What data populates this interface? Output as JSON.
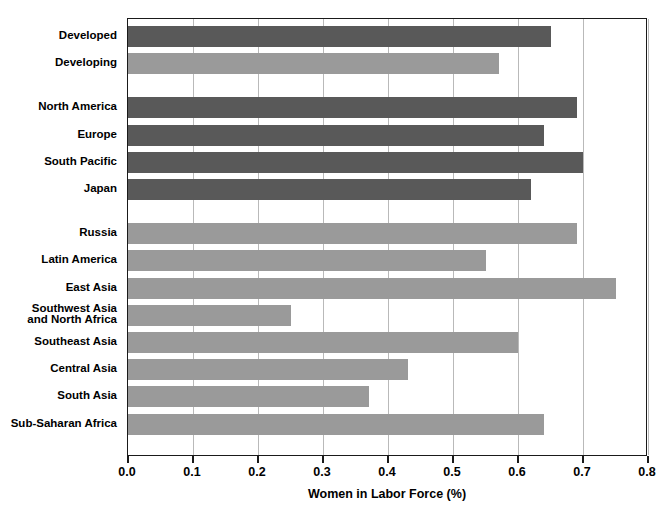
{
  "chart_data": {
    "type": "bar",
    "orientation": "horizontal",
    "title": "",
    "xlabel": "Women in Labor Force (%)",
    "ylabel": "",
    "xlim": [
      0.0,
      0.8
    ],
    "xticks": [
      "0.0",
      "0.1",
      "0.2",
      "0.3",
      "0.4",
      "0.5",
      "0.6",
      "0.7",
      "0.8"
    ],
    "xtick_values": [
      0.0,
      0.1,
      0.2,
      0.3,
      0.4,
      0.5,
      0.6,
      0.7,
      0.8
    ],
    "grid": "vertical",
    "legend": "none",
    "colors": {
      "dark_bar": "#595959",
      "light_bar": "#9a9a9a",
      "gridline": "#b9b9b9",
      "axis": "#1a1a1a"
    },
    "categories": [
      "Developed",
      "Developing",
      "North America",
      "Europe",
      "South Pacific",
      "Japan",
      "Russia",
      "Latin America",
      "East Asia",
      "Southwest Asia\nand North Africa",
      "Southeast Asia",
      "Central Asia",
      "South Asia",
      "Sub-Saharan Africa"
    ],
    "values": [
      0.65,
      0.57,
      0.69,
      0.64,
      0.7,
      0.62,
      0.69,
      0.55,
      0.75,
      0.25,
      0.6,
      0.43,
      0.37,
      0.64
    ],
    "bars": [
      {
        "label": "Developed",
        "value": 0.65,
        "shade": "dark",
        "group": 0
      },
      {
        "label": "Developing",
        "value": 0.57,
        "shade": "light",
        "group": 0
      },
      {
        "label": "North America",
        "value": 0.69,
        "shade": "dark",
        "group": 1
      },
      {
        "label": "Europe",
        "value": 0.64,
        "shade": "dark",
        "group": 1
      },
      {
        "label": "South Pacific",
        "value": 0.7,
        "shade": "dark",
        "group": 1
      },
      {
        "label": "Japan",
        "value": 0.62,
        "shade": "dark",
        "group": 1
      },
      {
        "label": "Russia",
        "value": 0.69,
        "shade": "light",
        "group": 2
      },
      {
        "label": "Latin America",
        "value": 0.55,
        "shade": "light",
        "group": 2
      },
      {
        "label": "East Asia",
        "value": 0.75,
        "shade": "light",
        "group": 2
      },
      {
        "label": "Southwest Asia\nand North Africa",
        "value": 0.25,
        "shade": "light",
        "group": 2
      },
      {
        "label": "Southeast Asia",
        "value": 0.6,
        "shade": "light",
        "group": 2
      },
      {
        "label": "Central Asia",
        "value": 0.43,
        "shade": "light",
        "group": 2
      },
      {
        "label": "South Asia",
        "value": 0.37,
        "shade": "light",
        "group": 2
      },
      {
        "label": "Sub-Saharan Africa",
        "value": 0.64,
        "shade": "light",
        "group": 2
      }
    ]
  }
}
